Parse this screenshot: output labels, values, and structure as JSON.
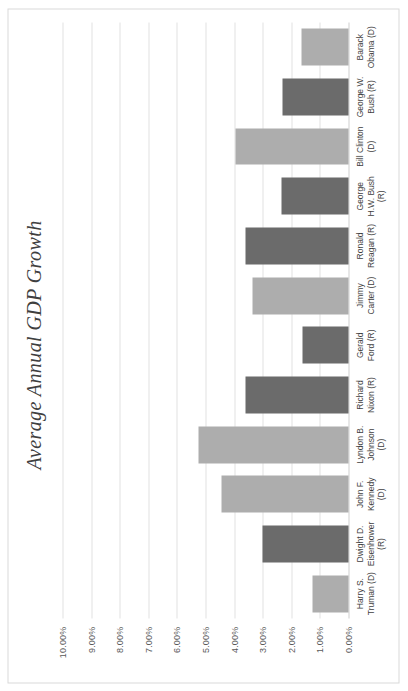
{
  "chart_data": {
    "type": "bar",
    "title": "Average Annual GDP Growth",
    "xlabel": "",
    "ylabel": "",
    "ylim": [
      0,
      10
    ],
    "ytick_labels": [
      "10.00%",
      "9.00%",
      "8.00%",
      "7.00%",
      "6.00%",
      "5.00%",
      "4.00%",
      "3.00%",
      "2.00%",
      "1.00%",
      "0.00%"
    ],
    "ytick_values": [
      10,
      9,
      8,
      7,
      6,
      5,
      4,
      3,
      2,
      1,
      0
    ],
    "grid": true,
    "legend": "none",
    "orientation": "page-rotated-90",
    "categories": [
      "Harry S. Truman (D)",
      "Dwight D. Eisenhower (R)",
      "John F. Kennedy (D)",
      "Lyndon B. Johnson (D)",
      "Richard Nixon (R)",
      "Gerald Ford (R)",
      "Jimmy Carter (D)",
      "Ronald Reagan (R)",
      "George H.W. Bush (R)",
      "Bill Clinton (D)",
      "George W. Bush (R)",
      "Barack Obama (D)"
    ],
    "category_labels": [
      "Harry S.\nTruman (D)",
      "Dwight D.\nEisenhower\n(R)",
      "John F.\nKennedy\n(D)",
      "Lyndon B.\nJohnson\n(D)",
      "Richard\nNixon (R)",
      "Gerald\nFord (R)",
      "Jimmy\nCarter (D)",
      "Ronald\nReagan (R)",
      "George\nH.W. Bush\n(R)",
      "Bill Clinton\n(D)",
      "George W.\nBush (R)",
      "Barack\nObama (D)"
    ],
    "parties": [
      "D",
      "R",
      "D",
      "D",
      "R",
      "R",
      "D",
      "R",
      "R",
      "D",
      "R",
      "D"
    ],
    "values": [
      1.25,
      3.0,
      4.45,
      5.25,
      3.6,
      1.6,
      3.35,
      3.6,
      2.35,
      3.95,
      2.3,
      1.65
    ],
    "colors": {
      "republican_bar": "#6b6b6b",
      "democrat_bar": "#adadad",
      "gridline": "#e2e2e2",
      "axis_text": "#3f3f3f",
      "title_text": "#3f3f3f",
      "plot_background": "#ffffff",
      "frame_border": "#d9d9d9"
    }
  },
  "axis_caption": ""
}
